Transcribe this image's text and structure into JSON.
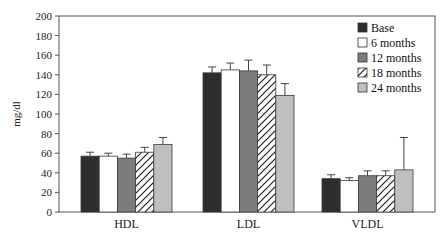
{
  "chart_data": {
    "type": "bar",
    "title": "",
    "xlabel": "",
    "ylabel": "mg/dl",
    "ylim": [
      0,
      200
    ],
    "yticks": [
      0,
      20,
      40,
      60,
      80,
      100,
      120,
      140,
      160,
      180,
      200
    ],
    "categories": [
      "HDL",
      "LDL",
      "VLDL"
    ],
    "grid": false,
    "legend_position": "top-right",
    "error_bars": true,
    "series": [
      {
        "name": "Base",
        "style": "solid",
        "color": "#2e2e2e",
        "values": [
          57,
          142,
          34
        ],
        "errors": [
          4,
          6,
          4
        ]
      },
      {
        "name": "6 months",
        "style": "solid",
        "color": "#ffffff",
        "values": [
          57,
          145,
          32
        ],
        "errors": [
          3,
          7,
          3
        ]
      },
      {
        "name": "12 months",
        "style": "solid",
        "color": "#7c7c7c",
        "values": [
          55,
          144,
          37
        ],
        "errors": [
          4,
          11,
          5
        ]
      },
      {
        "name": "18 months",
        "style": "hatch",
        "color": "#ffffff",
        "values": [
          61,
          140,
          37
        ],
        "errors": [
          5,
          10,
          5
        ]
      },
      {
        "name": "24 months",
        "style": "solid",
        "color": "#bfbfbf",
        "values": [
          69,
          119,
          43
        ],
        "errors": [
          7,
          12,
          33
        ]
      }
    ]
  }
}
